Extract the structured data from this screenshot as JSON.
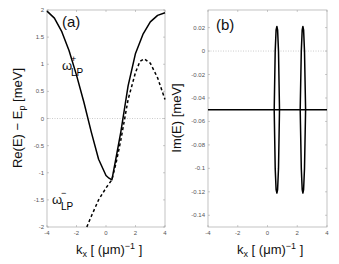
{
  "chart_data": [
    {
      "type": "line",
      "panel_label": "(a)",
      "title": "",
      "xlabel": "k_x [ (μm)^-1 ]",
      "ylabel": "Re(E) − E_p [meV]",
      "xlim": [
        -4,
        4
      ],
      "ylim": [
        -2,
        2
      ],
      "xticks": [
        -4,
        -2,
        0,
        2,
        4
      ],
      "yticks": [
        -2,
        -1.5,
        -1,
        -0.5,
        0,
        0.5,
        1,
        1.5,
        2
      ],
      "grid": false,
      "reference_line": {
        "y": 0,
        "style": "dotted"
      },
      "annotations": [
        {
          "text": "ω_LP^+",
          "x": -1.8,
          "y": 1.05
        },
        {
          "text": "ω_LP^-",
          "x": -2.0,
          "y": -1.55
        }
      ],
      "series": [
        {
          "name": "ω_LP^+ (solid)",
          "style": "solid",
          "x": [
            -4,
            -3.5,
            -3,
            -2.5,
            -2,
            -1.5,
            -1,
            -0.5,
            0,
            0.2,
            0.4,
            0.7,
            1,
            1.5,
            2,
            2.5,
            3,
            3.5,
            4
          ],
          "y": [
            1.98,
            1.85,
            1.6,
            1.25,
            0.8,
            0.3,
            -0.25,
            -0.75,
            -1.05,
            -1.1,
            -1.13,
            -0.7,
            -0.25,
            0.6,
            1.2,
            1.55,
            1.78,
            1.9,
            1.95
          ]
        },
        {
          "name": "ω_LP^- (dashed)",
          "style": "dashed",
          "x": [
            -1.3,
            -1,
            -0.5,
            0,
            0.4,
            0.7,
            1,
            1.5,
            2,
            2.3,
            2.6,
            3,
            3.5,
            4
          ],
          "y": [
            -2,
            -1.8,
            -1.5,
            -1.28,
            -1.13,
            -0.8,
            -0.4,
            0.35,
            0.85,
            1.05,
            1.1,
            1.02,
            0.75,
            0.35
          ]
        }
      ]
    },
    {
      "type": "line",
      "panel_label": "(b)",
      "title": "",
      "xlabel": "k_x [ (μm)^-1 ]",
      "ylabel": "Im(E) [meV]",
      "xlim": [
        -4,
        4
      ],
      "ylim": [
        -0.15,
        0.035
      ],
      "xticks": [
        -4,
        -2,
        0,
        2,
        4
      ],
      "yticks": [
        0.02,
        0,
        -0.02,
        -0.04,
        -0.06,
        -0.08,
        -0.1,
        -0.12,
        -0.14
      ],
      "grid": false,
      "reference_line": {
        "y": 0,
        "style": "dotted"
      },
      "series": [
        {
          "name": "flat branch",
          "style": "solid",
          "x": [
            -4,
            4
          ],
          "y": [
            -0.05,
            -0.05
          ]
        },
        {
          "name": "split branch 1",
          "style": "solid",
          "x": [
            0.45,
            0.52,
            0.58,
            0.63,
            0.68,
            0.74,
            0.81,
            0.74,
            0.68,
            0.63,
            0.58,
            0.52,
            0.45
          ],
          "y": [
            -0.05,
            0.0,
            0.018,
            0.021,
            0.018,
            0.0,
            -0.05,
            -0.1,
            -0.118,
            -0.121,
            -0.118,
            -0.1,
            -0.05
          ]
        },
        {
          "name": "split branch 2",
          "style": "solid",
          "x": [
            2.2,
            2.27,
            2.33,
            2.38,
            2.43,
            2.49,
            2.56,
            2.49,
            2.43,
            2.38,
            2.33,
            2.27,
            2.2
          ],
          "y": [
            -0.05,
            0.0,
            0.018,
            0.021,
            0.018,
            0.0,
            -0.05,
            -0.1,
            -0.118,
            -0.121,
            -0.118,
            -0.1,
            -0.05
          ]
        }
      ]
    }
  ],
  "labels": {
    "a_panel": "(a)",
    "b_panel": "(b)",
    "a_ylabel": "Re(E) − E",
    "a_ylabel_sub": "p",
    "a_ylabel_unit": " [meV]",
    "b_ylabel": "Im(E) [meV]",
    "xlabel_main": "k",
    "xlabel_sub": "x",
    "xlabel_unit": " [ (μm)",
    "xlabel_sup": "−1",
    "xlabel_close": " ]",
    "omega": "ω",
    "lp": "LP",
    "plus": "+",
    "minus": "−"
  }
}
